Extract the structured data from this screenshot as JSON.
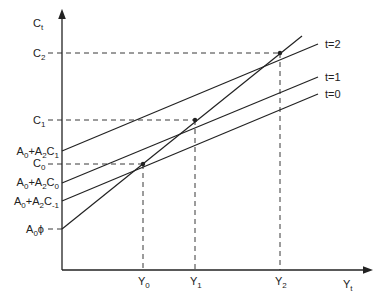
{
  "diagram": {
    "y_axis_label": "C",
    "y_axis_label_sub": "t",
    "x_axis_label": "Y",
    "x_axis_label_sub": "t",
    "y_ticks": [
      {
        "main": "C",
        "sub": "2"
      },
      {
        "main": "C",
        "sub": "1"
      },
      {
        "main": "C",
        "sub": "0"
      }
    ],
    "intercepts": [
      {
        "pre": "A",
        "pre_sub": "0",
        "mid": "+A",
        "mid_sub": "2",
        "post": "C",
        "post_sub": "1"
      },
      {
        "pre": "A",
        "pre_sub": "0",
        "mid": "+A",
        "mid_sub": "2",
        "post": "C",
        "post_sub": "0"
      },
      {
        "pre": "A",
        "pre_sub": "0",
        "mid": "+A",
        "mid_sub": "2",
        "post": "C",
        "post_sub": "-1"
      },
      {
        "pre": "A",
        "pre_sub": "0",
        "mid": "ϕ",
        "mid_sub": "",
        "post": "",
        "post_sub": ""
      }
    ],
    "x_ticks": [
      {
        "main": "Y",
        "sub": "0"
      },
      {
        "main": "Y",
        "sub": "1"
      },
      {
        "main": "Y",
        "sub": "2"
      }
    ],
    "line_labels": [
      "t=2",
      "t=1",
      "t=0"
    ],
    "colors": {
      "line": "#222222",
      "background": "#ffffff"
    }
  }
}
